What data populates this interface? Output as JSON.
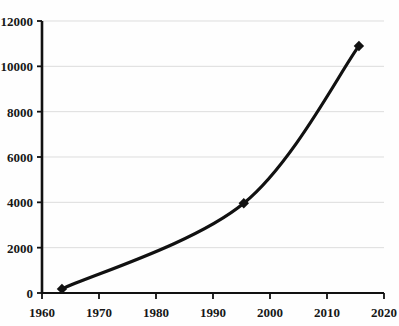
{
  "chart_data": {
    "type": "line",
    "title": "",
    "subtitle": "",
    "xlabel": "",
    "ylabel": "",
    "xlim": [
      1960,
      2020
    ],
    "ylim": [
      0,
      12000
    ],
    "grid": true,
    "grid_axis": "y",
    "legend": false,
    "legend_position": "none",
    "line_color": "#111111",
    "line_width": 3.2,
    "marker": "diamond",
    "marker_color": "#111111",
    "background_color": "#fefefe",
    "gridline_color": "#dddddd",
    "axis_color": "#111111",
    "x": [
      1963.5,
      1995.4,
      2015.6
    ],
    "y": [
      180,
      3960,
      10900
    ],
    "series": [
      {
        "name": "series-1",
        "points": [
          {
            "x": 1963.5,
            "y": 180
          },
          {
            "x": 1995.4,
            "y": 3960
          },
          {
            "x": 2015.6,
            "y": 10900
          }
        ]
      }
    ],
    "xticks": [
      1960,
      1970,
      1980,
      1990,
      2000,
      2010,
      2020
    ],
    "xtick_labels": [
      "1960",
      "1970",
      "1980",
      "1990",
      "2000",
      "2010",
      "2020"
    ],
    "yticks": [
      0,
      2000,
      4000,
      6000,
      8000,
      10000,
      12000
    ],
    "ytick_labels": [
      "0",
      "2000",
      "4000",
      "6000",
      "8000",
      "10000",
      "12000"
    ],
    "annotations": []
  },
  "axes": {
    "y_axis_name": "y-axis",
    "x_axis_name": "x-axis"
  }
}
